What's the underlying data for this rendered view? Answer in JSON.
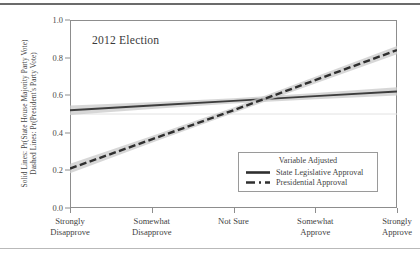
{
  "chart_data": {
    "type": "line",
    "title": "2012 Election",
    "xlabel": "",
    "ylabel_lines": [
      "Solid Lines: Pr(State House Majority Party Vote)",
      "Dashed Lines: Pr(President's Party Vote)"
    ],
    "categories": [
      "Strongly Disapprove",
      "Somewhat Disapprove",
      "Not Sure",
      "Somewhat Approve",
      "Strongly Approve"
    ],
    "category_lines": [
      [
        "Strongly",
        "Disapprove"
      ],
      [
        "Somewhat",
        "Disapprove"
      ],
      [
        "Not Sure",
        ""
      ],
      [
        "Somewhat",
        "Approve"
      ],
      [
        "Strongly",
        "Approve"
      ]
    ],
    "x": [
      1,
      2,
      3,
      4,
      5
    ],
    "ylim": [
      0.0,
      1.0
    ],
    "yticks": [
      "0.0",
      "0.2",
      "0.4",
      "0.6",
      "0.8",
      "1.0"
    ],
    "ytick_values": [
      0.0,
      0.2,
      0.4,
      0.6,
      0.8,
      1.0
    ],
    "grid": "horizontal-reference-at-0.5",
    "reference_line_y": 0.5,
    "legend_position": "lower-right",
    "series": [
      {
        "name": "State Legislative Approval",
        "style": "solid",
        "values": [
          0.52,
          0.545,
          0.57,
          0.595,
          0.62
        ],
        "ci_lower": [
          0.495,
          0.527,
          0.556,
          0.578,
          0.598
        ],
        "ci_upper": [
          0.545,
          0.563,
          0.584,
          0.612,
          0.642
        ],
        "color": "#3d3d3d",
        "band_color": "#c9c9c9"
      },
      {
        "name": "Presidential Approval",
        "style": "dashed",
        "values": [
          0.21,
          0.365,
          0.52,
          0.68,
          0.84
        ],
        "ci_lower": [
          0.185,
          0.347,
          0.505,
          0.662,
          0.818
        ],
        "ci_upper": [
          0.235,
          0.383,
          0.535,
          0.698,
          0.862
        ],
        "color": "#2f2f2f",
        "band_color": "#c9c9c9"
      }
    ]
  },
  "chart": {
    "title": "2012 Election",
    "legend": {
      "title": "Variable Adjusted",
      "items": [
        {
          "label": "State Legislative Approval",
          "style": "solid"
        },
        {
          "label": "Presidential Approval",
          "style": "dashed"
        }
      ]
    },
    "axis": {
      "y_caption_line1": "Solid Lines: Pr(State House Majority Party Vote)",
      "y_caption_line2": "Dashed Lines: Pr(President's Party Vote)",
      "yticks": [
        "0.0",
        "0.2",
        "0.4",
        "0.6",
        "0.8",
        "1.0"
      ]
    }
  }
}
